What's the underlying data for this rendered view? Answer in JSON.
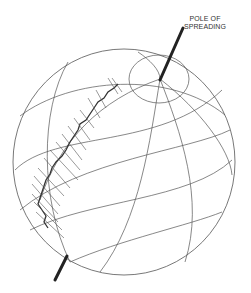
{
  "diagram": {
    "label_line1": "POLE OF",
    "label_line2": "SPREADING",
    "colors": {
      "stroke": "#444444",
      "axis": "#222222",
      "background": "#ffffff"
    },
    "elements": [
      "globe-outline",
      "meridians",
      "parallels",
      "pole-circle",
      "rotation-axis",
      "ridge-segments",
      "transform-faults"
    ]
  }
}
